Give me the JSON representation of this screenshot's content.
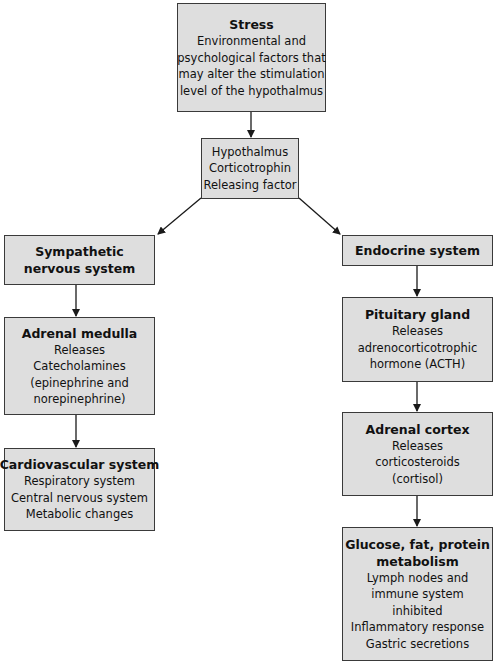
{
  "diagram": {
    "nodes": {
      "stress": {
        "title": "Stress",
        "lines": [
          "Environmental and",
          "psychological factors that",
          "may alter the stimulation",
          "level of the hypothalmus"
        ]
      },
      "hypothalamus": {
        "title": "",
        "lines": [
          "Hypothalmus",
          "Corticotrophin",
          "Releasing factor"
        ]
      },
      "sympathetic": {
        "title_lines": [
          "Sympathetic",
          "nervous system"
        ]
      },
      "adrenal_medulla": {
        "title": "Adrenal medulla",
        "lines": [
          "Releases",
          "Catecholamines",
          "(epinephrine and",
          "norepinephrine)"
        ]
      },
      "cardiovascular": {
        "title": "Cardiovascular system",
        "lines": [
          "Respiratory system",
          "Central nervous system",
          "Metabolic changes"
        ]
      },
      "endocrine": {
        "title": "Endocrine system"
      },
      "pituitary": {
        "title": "Pituitary gland",
        "lines": [
          "Releases",
          "adrenocorticotrophic",
          "hormone (ACTH)"
        ]
      },
      "adrenal_cortex": {
        "title": "Adrenal cortex",
        "lines": [
          "Releases",
          "corticosteroids",
          "(cortisol)"
        ]
      },
      "metabolism": {
        "title_lines": [
          "Glucose, fat, protein",
          "metabolism"
        ],
        "lines": [
          "Lymph nodes and",
          "immune system",
          "inhibited",
          "Inflammatory response",
          "Gastric secretions"
        ]
      }
    },
    "edges": [
      {
        "from": "stress",
        "to": "hypothalamus"
      },
      {
        "from": "hypothalamus",
        "to": "sympathetic"
      },
      {
        "from": "hypothalamus",
        "to": "endocrine"
      },
      {
        "from": "sympathetic",
        "to": "adrenal_medulla"
      },
      {
        "from": "adrenal_medulla",
        "to": "cardiovascular"
      },
      {
        "from": "endocrine",
        "to": "pituitary"
      },
      {
        "from": "pituitary",
        "to": "adrenal_cortex"
      },
      {
        "from": "adrenal_cortex",
        "to": "metabolism"
      }
    ],
    "colors": {
      "box_fill": "#dedede",
      "border": "#3a3a3a",
      "arrow": "#1a1a1a"
    }
  }
}
